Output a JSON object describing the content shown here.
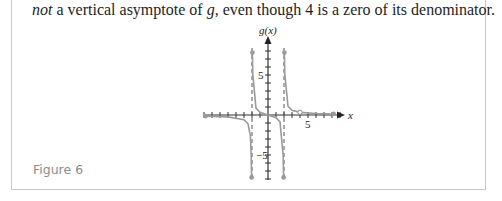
{
  "text": {
    "italic_lead": "not",
    "rest": " a vertical asymptote of ",
    "var_g": "g",
    "tail": ", even though 4 is a zero of its denominator."
  },
  "figure": {
    "caption": "Figure 6",
    "y_axis_label": "g(x)",
    "x_axis_label": "x",
    "x_tick_label": "5",
    "y_tick_label_pos": "5",
    "y_tick_label_neg": "−5"
  },
  "chart_data": {
    "type": "line",
    "title": "",
    "xlabel": "x",
    "ylabel": "g(x)",
    "xlim": [
      -8,
      9
    ],
    "ylim": [
      -8,
      9
    ],
    "tick_spacing": 1,
    "labeled_ticks": {
      "x": [
        5
      ],
      "y": [
        5,
        -5
      ]
    },
    "vertical_asymptotes": [
      -2,
      2
    ],
    "holes": [
      {
        "x": 4,
        "y": 0.333
      }
    ],
    "series": [
      {
        "name": "left branch (x < -2)",
        "points": [
          [
            -7.8,
            -0.14
          ],
          [
            -5,
            -0.24
          ],
          [
            -3,
            -0.6
          ],
          [
            -2.5,
            -1.1
          ],
          [
            -2.2,
            -2.6
          ],
          [
            -2.1,
            -5.1
          ],
          [
            -2.05,
            -7.8
          ]
        ]
      },
      {
        "name": "middle branch (-2 < x < 2)",
        "points": [
          [
            -1.95,
            7.8
          ],
          [
            -1.9,
            5.1
          ],
          [
            -1.5,
            0.86
          ],
          [
            -1,
            0.33
          ],
          [
            0,
            0
          ],
          [
            1,
            -0.33
          ],
          [
            1.5,
            -0.86
          ],
          [
            1.9,
            -5.1
          ],
          [
            1.95,
            -7.8
          ]
        ]
      },
      {
        "name": "right branch (x > 2)",
        "points": [
          [
            2.05,
            7.8
          ],
          [
            2.1,
            5.1
          ],
          [
            2.5,
            1.1
          ],
          [
            3,
            0.6
          ],
          [
            4,
            0.33
          ],
          [
            6,
            0.19
          ],
          [
            8.2,
            0.13
          ]
        ]
      }
    ],
    "grid": false,
    "legend": null
  }
}
